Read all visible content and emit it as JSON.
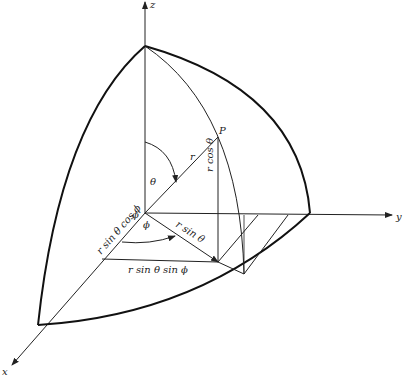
{
  "diagram": {
    "axes": {
      "x": "x",
      "y": "y",
      "z": "z"
    },
    "point": "P",
    "labels": {
      "r": "r",
      "theta": "θ",
      "phi": "ϕ",
      "origin_phi": "ϕ",
      "r_cos_theta": "r cos θ",
      "r_sin_theta": "r sin θ",
      "r_sin_theta_cos_phi": "r sin θ cos ϕ",
      "r_sin_theta_sin_phi": "r sin θ sin ϕ"
    }
  }
}
